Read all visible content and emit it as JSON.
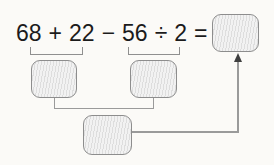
{
  "expression": {
    "tokens": [
      "68",
      "+",
      "22",
      "−",
      "56",
      "÷",
      "2",
      "="
    ],
    "full": "68 + 22 − 56 ÷ 2 ="
  },
  "diagram": {
    "slots": [
      {
        "id": "group-1-sum",
        "under": "68 + 22",
        "value": ""
      },
      {
        "id": "group-2-quotient",
        "under": "56 ÷ 2",
        "value": ""
      },
      {
        "id": "combined-result",
        "under": "group-1 and group-2",
        "value": ""
      },
      {
        "id": "final-answer",
        "after": "=",
        "value": ""
      }
    ],
    "arrow": "from combined-result box up to final-answer box"
  },
  "colors": {
    "background": "#fbfaf7",
    "text": "#1b1b1b",
    "box_fill": "#ececec",
    "box_border": "#8d8d8d",
    "connector": "#9a9a9a",
    "arrowhead": "#3f3f3f"
  }
}
